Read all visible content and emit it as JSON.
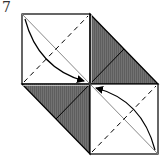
{
  "step": {
    "number": "7"
  },
  "diagram": {
    "colors": {
      "paper_white": "#ffffff",
      "paper_shaded": "#6a6a6a",
      "line": "#000000",
      "thin_line": "#777777"
    },
    "points": {
      "top_left": [
        22,
        14
      ],
      "top_mid": [
        90,
        14
      ],
      "center": [
        90,
        84
      ],
      "left": [
        22,
        84
      ],
      "right": [
        158,
        84
      ],
      "bottom_mid": [
        90,
        154
      ],
      "bottom_right": [
        158,
        154
      ]
    },
    "regions": [
      {
        "name": "top-left-square",
        "fill": "white"
      },
      {
        "name": "top-right-shaded-triangle",
        "fill": "shaded"
      },
      {
        "name": "bottom-left-shaded-triangle",
        "fill": "shaded"
      },
      {
        "name": "bottom-right-square",
        "fill": "white"
      }
    ],
    "arrows": [
      {
        "name": "arrow-top-left-to-center",
        "from": [
          25,
          19
        ],
        "to": [
          86,
          82
        ]
      },
      {
        "name": "arrow-bottom-right-to-center",
        "from": [
          155,
          150
        ],
        "to": [
          94,
          87
        ]
      }
    ],
    "fold_lines": [
      {
        "name": "valley-fold-top-left",
        "type": "dashed",
        "from": [
          24,
          82
        ],
        "to": [
          88,
          16
        ]
      },
      {
        "name": "valley-fold-bottom-right",
        "type": "dashed",
        "from": [
          92,
          152
        ],
        "to": [
          156,
          86
        ]
      }
    ]
  }
}
